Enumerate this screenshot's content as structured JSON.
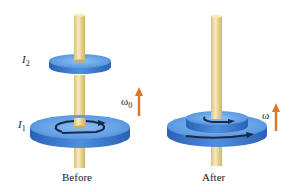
{
  "panels": [
    {
      "caption": "Before",
      "disk_top_label": "I",
      "disk_top_sub": "2",
      "disk_bottom_label": "I",
      "disk_bottom_sub": "1",
      "omega_label": "ω",
      "omega_sub": "0"
    },
    {
      "caption": "After",
      "omega_label": "ω"
    }
  ],
  "colors": {
    "disk_top": "#6aa7e6",
    "disk_side": "#2f6fc4",
    "rod": "#f2dfa0",
    "rod_shade": "#d9c27a",
    "arrow_vector": "#d9782d",
    "rotation_arrow": "#1a2a4a"
  }
}
